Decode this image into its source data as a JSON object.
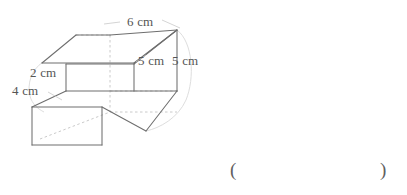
{
  "figure": {
    "kind": "l-shaped-step-prism-3d",
    "stroke_color": "#6e6e6e",
    "hidden_stroke_color": "#c2c2c2",
    "arc_color": "#d4d4d4",
    "background_color": "#ffffff",
    "labels": [
      {
        "id": "top-length",
        "text": "6 cm",
        "x": 127,
        "y": 15
      },
      {
        "id": "depth-upper",
        "text": "5 cm",
        "x": 138,
        "y": 54
      },
      {
        "id": "depth-lower",
        "text": "5 cm",
        "x": 172,
        "y": 54
      },
      {
        "id": "step-height",
        "text": "2 cm",
        "x": 30,
        "y": 66
      },
      {
        "id": "base-height",
        "text": "4 cm",
        "x": 12,
        "y": 84
      }
    ]
  },
  "answer_field": {
    "open_paren": "(",
    "close_paren": ")",
    "value": "",
    "open_x": 230,
    "close_x": 380,
    "y": 160
  }
}
